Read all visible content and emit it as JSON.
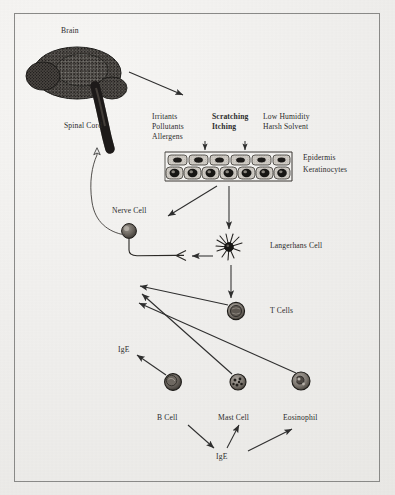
{
  "figure": {
    "background_color": "#efeeec",
    "ink_color": "#2b2b2b",
    "frame_color": "#8a8a88"
  },
  "labels": {
    "brain": "Brain",
    "spinal_cord": "Spinal Cord",
    "irritants": "Irritants",
    "pollutants": "Pollutants",
    "allergens": "Allergens",
    "scratching": "Scratching",
    "itching": "Itching",
    "low_humidity": "Low Humidity",
    "harsh_solvent": "Harsh Solvent",
    "epidermis": "Epidermis",
    "keratinocytes": "Keratinocytes",
    "nerve_cell": "Nerve Cell",
    "langerhans_cell": "Langerhans Cell",
    "t_cells": "T Cells",
    "ige_left": "IgE",
    "b_cell": "B Cell",
    "mast_cell": "Mast Cell",
    "eosinophil": "Eosinophil",
    "ige_bottom": "IgE"
  },
  "nodes": [
    {
      "name": "brain",
      "kind": "organ",
      "x": 78,
      "y": 75
    },
    {
      "name": "keratinocytes",
      "kind": "cell-strip",
      "x": 228,
      "y": 166
    },
    {
      "name": "nerve-cell",
      "kind": "neuron",
      "x": 128,
      "y": 227
    },
    {
      "name": "langerhans-cell",
      "kind": "dendritic",
      "x": 229,
      "y": 247
    },
    {
      "name": "t-cell",
      "kind": "round-cell",
      "x": 236,
      "y": 311
    },
    {
      "name": "b-cell",
      "kind": "round-cell",
      "x": 173,
      "y": 382
    },
    {
      "name": "mast-cell",
      "kind": "round-cell",
      "x": 238,
      "y": 382
    },
    {
      "name": "eosinophil",
      "kind": "round-cell",
      "x": 301,
      "y": 381
    }
  ],
  "arrows": [
    {
      "name": "brain-to-triggers",
      "from": "brain",
      "to": "irritants-text"
    },
    {
      "name": "triggers-to-epidermis",
      "from": "triggers-text",
      "to": "keratinocytes"
    },
    {
      "name": "epidermis-to-nerve",
      "from": "keratinocytes",
      "to": "nerve-terminal"
    },
    {
      "name": "epidermis-to-langerhans",
      "from": "keratinocytes",
      "to": "langerhans-cell"
    },
    {
      "name": "langerhans-to-nerve",
      "from": "langerhans-cell",
      "to": "nerve-terminal"
    },
    {
      "name": "langerhans-to-tcell",
      "from": "langerhans-cell",
      "to": "t-cell"
    },
    {
      "name": "tcell-to-nerve",
      "from": "t-cell",
      "to": "nerve-terminal"
    },
    {
      "name": "mast-to-nerve",
      "from": "mast-cell",
      "to": "nerve-terminal"
    },
    {
      "name": "eosinophil-to-nerve",
      "from": "eosinophil",
      "to": "nerve-terminal"
    },
    {
      "name": "bcell-to-ige",
      "from": "b-cell",
      "to": "ige-left"
    },
    {
      "name": "ige-to-bcell-bottom",
      "from": "b-cell",
      "to": "ige-bottom"
    },
    {
      "name": "ige-to-mast",
      "from": "ige-bottom",
      "to": "mast-cell"
    },
    {
      "name": "ige-to-eosinophil",
      "from": "ige-bottom",
      "to": "eosinophil"
    },
    {
      "name": "nerve-to-spinal-cord",
      "from": "nerve-cell",
      "to": "spinal-cord"
    }
  ]
}
